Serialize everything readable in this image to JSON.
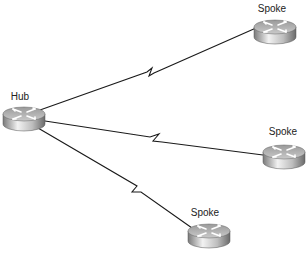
{
  "diagram": {
    "type": "hub-and-spoke network topology",
    "nodes": [
      {
        "id": "hub",
        "label": "Hub",
        "kind": "router",
        "cx": 24,
        "cy": 118,
        "label_x": 20,
        "label_y": 92
      },
      {
        "id": "spoke1",
        "label": "Spoke",
        "kind": "router",
        "cx": 275,
        "cy": 31,
        "label_x": 272,
        "label_y": 4
      },
      {
        "id": "spoke2",
        "label": "Spoke",
        "kind": "router",
        "cx": 284,
        "cy": 156,
        "label_x": 283,
        "label_y": 127
      },
      {
        "id": "spoke3",
        "label": "Spoke",
        "kind": "router",
        "cx": 209,
        "cy": 235,
        "label_x": 205,
        "label_y": 208
      }
    ],
    "links": [
      {
        "from": "hub",
        "to": "spoke1",
        "kind": "serial-wan",
        "path": "M40,110 L147,72 L152,68 L149,76 L154,73 L256,28"
      },
      {
        "from": "hub",
        "to": "spoke2",
        "kind": "serial-wan",
        "path": "M45,121 L150,137 L159,134 L153,141 L162,142 L263,155"
      },
      {
        "from": "hub",
        "to": "spoke3",
        "kind": "serial-wan",
        "path": "M38,128 L137,186 L132,192 L141,192 L192,228"
      }
    ]
  },
  "colors": {
    "background": "#ffffff",
    "link": "#1a1a1a",
    "router_top": "#b8b8b8",
    "router_side_dark": "#6e6e6e",
    "router_side_light": "#e8e8e8",
    "label": "#222222"
  }
}
